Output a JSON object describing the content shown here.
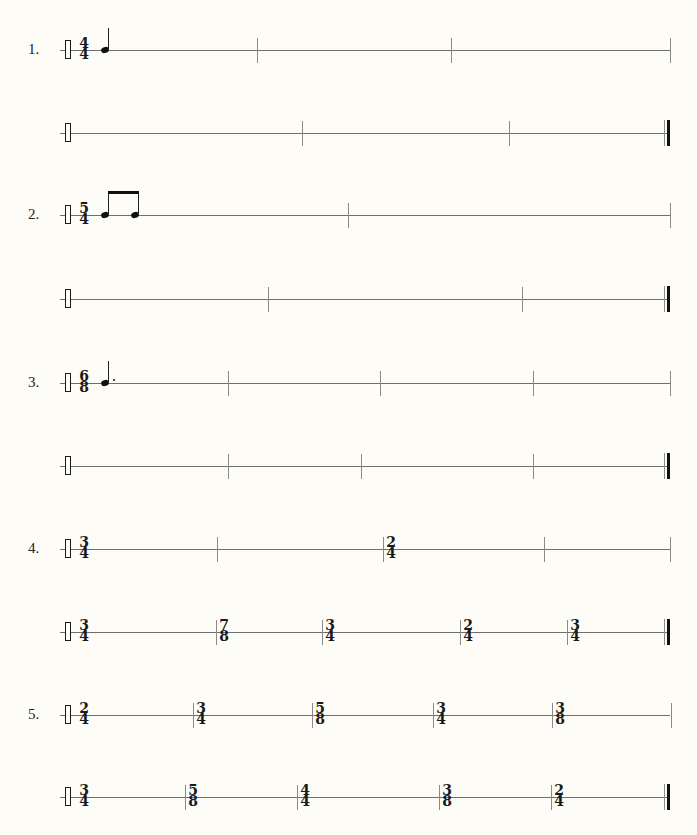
{
  "page": {
    "top_partial_text": "· · · · ·",
    "staff_line_color": "#6e6e6e",
    "background": "#fdfcf6"
  },
  "exercises": [
    {
      "number": "1.",
      "lines": [
        {
          "y": 50,
          "time_signature": {
            "top": "4",
            "bottom": "4"
          },
          "notes": "quarter-note",
          "barlines": [
            {
              "x": 257,
              "ts": null
            },
            {
              "x": 451,
              "ts": null
            },
            {
              "x": 670,
              "ts": null
            }
          ],
          "final": false
        },
        {
          "y": 133,
          "time_signature": null,
          "barlines": [
            {
              "x": 302,
              "ts": null
            },
            {
              "x": 509,
              "ts": null
            }
          ],
          "final": true
        }
      ]
    },
    {
      "number": "2.",
      "lines": [
        {
          "y": 215,
          "time_signature": {
            "top": "5",
            "bottom": "4"
          },
          "notes": "two-beamed-eighth-notes",
          "barlines": [
            {
              "x": 348,
              "ts": null
            },
            {
              "x": 670,
              "ts": null
            }
          ],
          "final": false
        },
        {
          "y": 299,
          "time_signature": null,
          "barlines": [
            {
              "x": 268,
              "ts": null
            },
            {
              "x": 522,
              "ts": null
            }
          ],
          "final": true
        }
      ]
    },
    {
      "number": "3.",
      "lines": [
        {
          "y": 383,
          "time_signature": {
            "top": "6",
            "bottom": "8"
          },
          "notes": "dotted-quarter-note",
          "barlines": [
            {
              "x": 228,
              "ts": null
            },
            {
              "x": 380,
              "ts": null
            },
            {
              "x": 533,
              "ts": null
            },
            {
              "x": 670,
              "ts": null
            }
          ],
          "final": false
        },
        {
          "y": 466,
          "time_signature": null,
          "barlines": [
            {
              "x": 228,
              "ts": null
            },
            {
              "x": 361,
              "ts": null
            },
            {
              "x": 533,
              "ts": null
            }
          ],
          "final": true
        }
      ]
    },
    {
      "number": "4.",
      "lines": [
        {
          "y": 549,
          "time_signature": {
            "top": "3",
            "bottom": "4"
          },
          "barlines": [
            {
              "x": 217,
              "ts": null
            },
            {
              "x": 383,
              "ts": {
                "top": "2",
                "bottom": "4"
              }
            },
            {
              "x": 544,
              "ts": null
            },
            {
              "x": 670,
              "ts": null
            }
          ],
          "final": false
        },
        {
          "y": 632,
          "time_signature": {
            "top": "3",
            "bottom": "4"
          },
          "barlines": [
            {
              "x": 216,
              "ts": {
                "top": "7",
                "bottom": "8"
              }
            },
            {
              "x": 322,
              "ts": {
                "top": "3",
                "bottom": "4"
              }
            },
            {
              "x": 460,
              "ts": {
                "top": "2",
                "bottom": "4"
              }
            },
            {
              "x": 567,
              "ts": {
                "top": "3",
                "bottom": "4"
              }
            }
          ],
          "final": true
        }
      ]
    },
    {
      "number": "5.",
      "lines": [
        {
          "y": 715,
          "time_signature": {
            "top": "2",
            "bottom": "4"
          },
          "barlines": [
            {
              "x": 193,
              "ts": {
                "top": "3",
                "bottom": "4"
              }
            },
            {
              "x": 312,
              "ts": {
                "top": "5",
                "bottom": "8"
              }
            },
            {
              "x": 433,
              "ts": {
                "top": "3",
                "bottom": "4"
              }
            },
            {
              "x": 552,
              "ts": {
                "top": "3",
                "bottom": "8"
              }
            },
            {
              "x": 671,
              "ts": null
            }
          ],
          "final": false
        },
        {
          "y": 797,
          "time_signature": {
            "top": "3",
            "bottom": "4"
          },
          "barlines": [
            {
              "x": 185,
              "ts": {
                "top": "5",
                "bottom": "8"
              }
            },
            {
              "x": 297,
              "ts": {
                "top": "4",
                "bottom": "4"
              }
            },
            {
              "x": 439,
              "ts": {
                "top": "3",
                "bottom": "8"
              }
            },
            {
              "x": 551,
              "ts": {
                "top": "2",
                "bottom": "4"
              }
            }
          ],
          "final": true
        }
      ]
    }
  ]
}
